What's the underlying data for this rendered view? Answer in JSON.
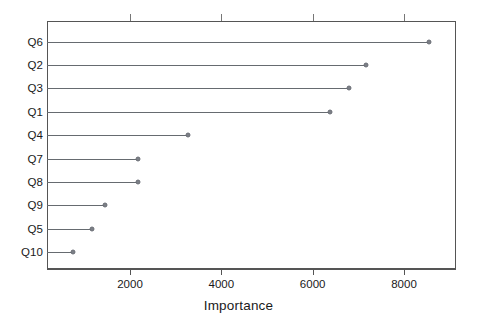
{
  "chart_data": {
    "type": "bar",
    "subtype": "lollipop-dotchart",
    "title": "",
    "xlabel": "Importance",
    "ylabel": "",
    "categories": [
      "Q6",
      "Q2",
      "Q3",
      "Q1",
      "Q4",
      "Q7",
      "Q8",
      "Q9",
      "Q5",
      "Q10"
    ],
    "values": [
      8538,
      7165,
      6791,
      6385,
      3275,
      2165,
      2176,
      1462,
      1176,
      747
    ],
    "xlim": [
      500,
      9500
    ],
    "xticks": [
      2000,
      4000,
      6000,
      8000
    ],
    "xticklabels": [
      "2000",
      "4000",
      "6000",
      "8000"
    ],
    "grid": false,
    "legend": null,
    "orientation": "horizontal",
    "series": [
      {
        "name": "Importance",
        "values": [
          8538,
          7165,
          6791,
          6385,
          3275,
          2165,
          2176,
          1462,
          1176,
          747
        ]
      }
    ],
    "colors": {
      "point": "#7b7f86",
      "line": "#666b70",
      "axis": "#555555",
      "text": "#1a1a1a",
      "background": "#ffffff"
    }
  },
  "axis": {
    "x_title": "Importance"
  }
}
